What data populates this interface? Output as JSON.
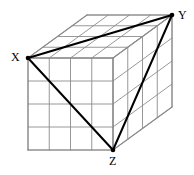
{
  "figure": {
    "name": "labeled-cuboid-grid-diagram",
    "background_color": "#ffffff",
    "width": 194,
    "height": 175,
    "grid_color": "#8c8c8c",
    "grid_stroke_width": 0.9,
    "edge_color": "#8c8c8c",
    "edge_stroke_width": 1.1,
    "triangle_color": "#000000",
    "triangle_stroke_width": 2.0,
    "vertex_dot_color": "#000000",
    "vertex_dot_radius": 2.3,
    "divisions": 4,
    "geometry": {
      "front_top_left": [
        28,
        58
      ],
      "front_top_right": [
        113,
        58
      ],
      "front_bottom_left": [
        28,
        150
      ],
      "front_bottom_right": [
        113,
        150
      ],
      "depth_dx": 59,
      "depth_dy": -43,
      "back_top_left": [
        87,
        15
      ],
      "back_top_right": [
        172,
        15
      ],
      "back_bottom_right": [
        172,
        107
      ],
      "back_bottom_left": [
        87,
        107
      ]
    }
  },
  "labels": [
    {
      "id": "X",
      "text": "X",
      "vertex": [
        28,
        58
      ],
      "left": 11,
      "top": 51
    },
    {
      "id": "Y",
      "text": "Y",
      "vertex": [
        172,
        15
      ],
      "left": 178,
      "top": 9
    },
    {
      "id": "Z",
      "text": "Z",
      "vertex": [
        113,
        150
      ],
      "left": 109,
      "top": 155
    }
  ],
  "triangle": {
    "name": "triangle-XYZ",
    "vertices": [
      "X",
      "Y",
      "Z"
    ],
    "edges": [
      {
        "from": "X",
        "to": "Y"
      },
      {
        "from": "Y",
        "to": "Z"
      },
      {
        "from": "Z",
        "to": "X"
      }
    ]
  }
}
